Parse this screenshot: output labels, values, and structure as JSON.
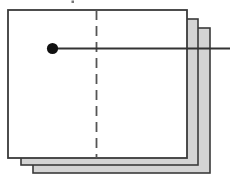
{
  "figure": {
    "title": "",
    "canvas": {
      "width": 230,
      "height": 185,
      "background": "#ffffff"
    },
    "colors": {
      "panel_face_front": "#ffffff",
      "panel_face_back": "#d4d4d4",
      "panel_stroke": "#3a3a3a",
      "line_stroke": "#333333",
      "dot_fill": "#111111",
      "dashed_stroke": "#555555",
      "speck_fill": "#777777"
    },
    "panels": [
      {
        "name": "back-panel",
        "label": "",
        "x": 33,
        "y": 28,
        "width": 177,
        "height": 145,
        "fill": "#d4d4d4",
        "stroke": "#3a3a3a",
        "stroke_width": 1.6
      },
      {
        "name": "middle-panel",
        "label": "",
        "x": 21,
        "y": 19,
        "width": 177,
        "height": 146,
        "fill": "#d4d4d4",
        "stroke": "#3a3a3a",
        "stroke_width": 1.6
      },
      {
        "name": "front-panel",
        "label": "",
        "x": 8,
        "y": 10,
        "width": 179,
        "height": 148,
        "fill": "#ffffff",
        "stroke": "#3a3a3a",
        "stroke_width": 1.8
      }
    ],
    "dashed_line": {
      "name": "vertical-dashed-line",
      "x": 96.5,
      "y1": 10,
      "y2": 158,
      "stroke": "#555555",
      "stroke_width": 1.8,
      "dash": "10 6"
    },
    "horizontal_line": {
      "name": "horizontal-axis-line",
      "x1": 52.5,
      "x2": 230,
      "y": 48.5,
      "stroke": "#333333",
      "stroke_width": 2.0
    },
    "marker": {
      "name": "data-point-dot",
      "cx": 52.5,
      "cy": 48.5,
      "r": 5.6,
      "fill": "#111111"
    },
    "speck": {
      "name": "top-speck-artifact",
      "x": 71.5,
      "y": 0.5,
      "width": 2.5,
      "height": 2.5,
      "fill": "#777777"
    }
  }
}
